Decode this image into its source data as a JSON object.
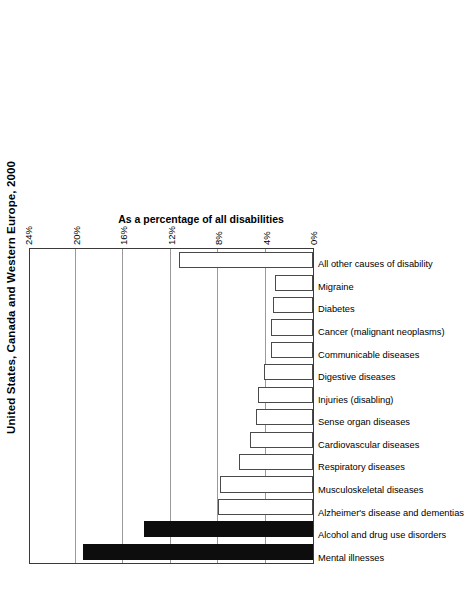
{
  "chart_data": {
    "type": "bar",
    "title": "United States, Canada and Western Europe, 2000",
    "orientation": "horizontal-rotated",
    "xlabel": "",
    "ylabel": "As a percentage of all disabilities",
    "ylim": [
      0,
      24
    ],
    "ytick_step": 4,
    "grid": true,
    "legend": "none",
    "tick_labels": [
      "0%",
      "4%",
      "8%",
      "12%",
      "16%",
      "20%",
      "24%"
    ],
    "tick_values": [
      0,
      4,
      8,
      12,
      16,
      20,
      24
    ],
    "categories": [
      "Mental illnesses",
      "Alcohol and drug use disorders",
      "Alzheimer's disease and dementias",
      "Musculoskeletal diseases",
      "Respiratory diseases",
      "Cardiovascular diseases",
      "Sense organ diseases",
      "Injuries (disabling)",
      "Digestive diseases",
      "Communicable diseases",
      "Cancer (malignant neoplasms)",
      "Diabetes",
      "Migraine",
      "All other causes of disability"
    ],
    "values": [
      19.4,
      14.2,
      8.0,
      7.8,
      6.2,
      5.3,
      4.8,
      4.6,
      4.1,
      3.5,
      3.5,
      3.4,
      3.2,
      11.3
    ],
    "highlighted": [
      "Mental illnesses",
      "Alcohol and drug use disorders"
    ],
    "colors": {
      "bar_fill": "#ffffff",
      "bar_highlight_fill": "#0d0d0d",
      "bar_outline": "#4a4a4a",
      "gridline": "#9a9a9a",
      "frame": "#3a3a3a",
      "text": "#000000"
    }
  }
}
